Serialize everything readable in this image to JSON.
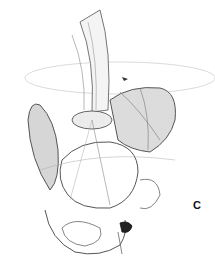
{
  "figure": {
    "panel_label": "C",
    "colors": {
      "stroke": "#555555",
      "shade": "#bbbbbb",
      "background": "#ffffff"
    }
  }
}
